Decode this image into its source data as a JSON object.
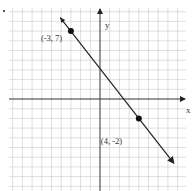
{
  "chart_data": {
    "type": "line",
    "title": "",
    "xlabel": "x",
    "ylabel": "y",
    "xlim": [
      -9,
      9
    ],
    "ylim": [
      -9,
      9
    ],
    "grid": true,
    "grid_step": 1,
    "series": [
      {
        "name": "line through points",
        "slope": -1.2857,
        "intercept": 3.1429,
        "x": [
          -4.1,
          7.6
        ],
        "y": [
          8.4,
          -6.6
        ],
        "arrows": "both"
      }
    ],
    "points": [
      {
        "x": -3,
        "y": 7,
        "label": "(-3, 7)"
      },
      {
        "x": 4,
        "y": -2,
        "label": "(4, -2)"
      }
    ],
    "annotations": [
      "(-3, 7)",
      "(4, -2)"
    ]
  },
  "labels": {
    "x_axis": "x",
    "y_axis": "y",
    "point_a": "(-3, 7)",
    "point_b": "(4, -2)"
  }
}
